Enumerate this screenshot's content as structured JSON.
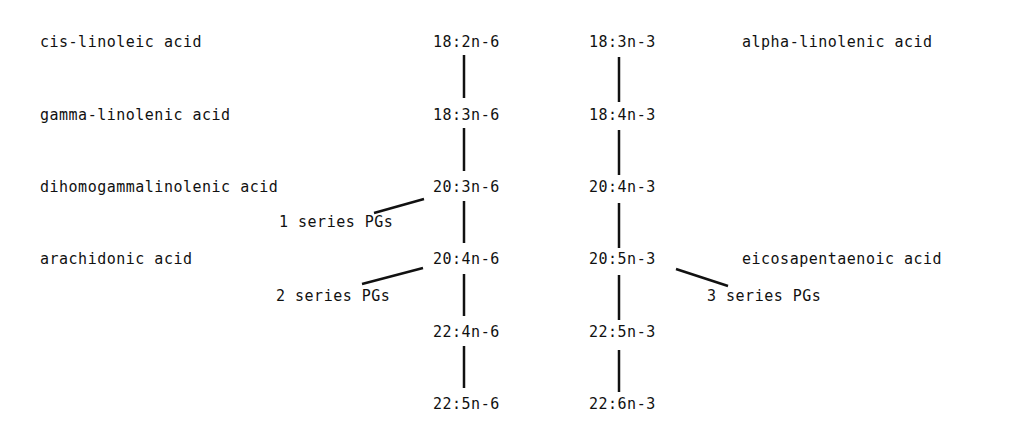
{
  "left_names": {
    "r1": "cis-linoleic acid",
    "r2": "gamma-linolenic acid",
    "r3": "dihomogammalinolenic acid",
    "r4": "arachidonic acid"
  },
  "right_names": {
    "r1": "alpha-linolenic acid",
    "r4": "eicosapentaenoic acid"
  },
  "n6": [
    "18:2n-6",
    "18:3n-6",
    "20:3n-6",
    "20:4n-6",
    "22:4n-6",
    "22:5n-6"
  ],
  "n3": [
    "18:3n-3",
    "18:4n-3",
    "20:4n-3",
    "20:5n-3",
    "22:5n-3",
    "22:6n-3"
  ],
  "pgs": {
    "s1": "1 series PGs",
    "s2": "2 series PGs",
    "s3": "3 series PGs"
  }
}
